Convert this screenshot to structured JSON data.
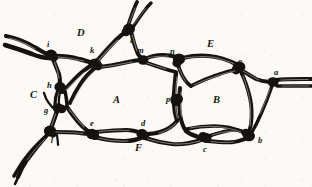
{
  "figure": {
    "kind": "engraving-vessel-network",
    "background_color": "#fbfaf7",
    "ink_color": "#151310",
    "width": 312,
    "height": 187,
    "region_labels": [
      {
        "id": "A",
        "text": "A",
        "x": 116,
        "y": 100,
        "role": "enclosed-area"
      },
      {
        "id": "B",
        "text": "B",
        "x": 216,
        "y": 100,
        "role": "enclosed-area"
      },
      {
        "id": "C",
        "text": "C",
        "x": 33,
        "y": 95,
        "role": "enclosed-area"
      },
      {
        "id": "D",
        "text": "D",
        "x": 80,
        "y": 33,
        "role": "enclosed-area"
      },
      {
        "id": "E",
        "text": "E",
        "x": 210,
        "y": 44,
        "role": "enclosed-area"
      },
      {
        "id": "F",
        "text": "F",
        "x": 138,
        "y": 148,
        "role": "enclosed-area"
      }
    ],
    "node_labels": [
      {
        "id": "a",
        "text": "a",
        "x": 276,
        "y": 72,
        "role": "junction"
      },
      {
        "id": "b",
        "text": "b",
        "x": 260,
        "y": 140,
        "role": "junction"
      },
      {
        "id": "c",
        "text": "c",
        "x": 205,
        "y": 148,
        "role": "junction"
      },
      {
        "id": "d",
        "text": "d",
        "x": 143,
        "y": 123,
        "role": "junction"
      },
      {
        "id": "e",
        "text": "e",
        "x": 92,
        "y": 123,
        "role": "junction"
      },
      {
        "id": "f",
        "text": "f",
        "x": 52,
        "y": 138,
        "role": "junction"
      },
      {
        "id": "g",
        "text": "g",
        "x": 46,
        "y": 110,
        "role": "junction"
      },
      {
        "id": "h",
        "text": "h",
        "x": 49,
        "y": 85,
        "role": "junction"
      },
      {
        "id": "i",
        "text": "i",
        "x": 48,
        "y": 44,
        "role": "junction"
      },
      {
        "id": "k",
        "text": "k",
        "x": 92,
        "y": 50,
        "role": "junction"
      },
      {
        "id": "l",
        "text": "l",
        "x": 131,
        "y": 40,
        "role": "junction"
      },
      {
        "id": "m",
        "text": "m",
        "x": 139,
        "y": 50,
        "role": "junction"
      },
      {
        "id": "n",
        "text": "n",
        "x": 172,
        "y": 51,
        "role": "junction"
      },
      {
        "id": "o",
        "text": "o",
        "x": 240,
        "y": 61,
        "role": "junction"
      },
      {
        "id": "p",
        "text": "p",
        "x": 169,
        "y": 100,
        "role": "junction"
      }
    ]
  }
}
